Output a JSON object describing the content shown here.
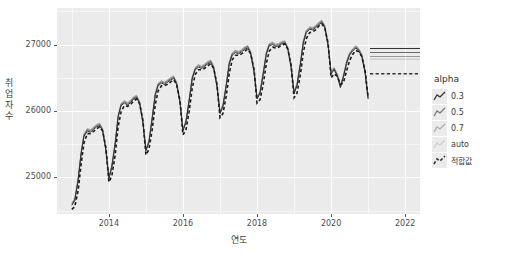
{
  "chart_data": {
    "type": "line",
    "title": "",
    "xlabel": "연도",
    "ylabel": "취업자 수",
    "xlim": [
      2012.6,
      2022.4
    ],
    "ylim": [
      24450,
      27550
    ],
    "xticks": [
      "2014",
      "2016",
      "2018",
      "2020",
      "2022"
    ],
    "xtick_values": [
      2014,
      2016,
      2018,
      2020,
      2022
    ],
    "yticks": [
      "25000",
      "26000",
      "27000"
    ],
    "ytick_values": [
      25000,
      26000,
      27000
    ],
    "grid": true,
    "legend_position": "right",
    "legend_title": "alpha",
    "series": [
      {
        "name": "0.3",
        "style": "solid",
        "opacity": 1.0,
        "color": "#333333",
        "x": [
          2013.0,
          2013.08,
          2013.17,
          2013.25,
          2013.33,
          2013.42,
          2013.5,
          2013.58,
          2013.67,
          2013.75,
          2013.83,
          2013.92,
          2014.0,
          2014.08,
          2014.17,
          2014.25,
          2014.33,
          2014.42,
          2014.5,
          2014.58,
          2014.67,
          2014.75,
          2014.83,
          2014.92,
          2015.0,
          2015.08,
          2015.17,
          2015.25,
          2015.33,
          2015.42,
          2015.5,
          2015.58,
          2015.67,
          2015.75,
          2015.83,
          2015.92,
          2016.0,
          2016.08,
          2016.17,
          2016.25,
          2016.33,
          2016.42,
          2016.5,
          2016.58,
          2016.67,
          2016.75,
          2016.83,
          2016.92,
          2017.0,
          2017.08,
          2017.17,
          2017.25,
          2017.33,
          2017.42,
          2017.5,
          2017.58,
          2017.67,
          2017.75,
          2017.83,
          2017.92,
          2018.0,
          2018.08,
          2018.17,
          2018.25,
          2018.33,
          2018.42,
          2018.5,
          2018.58,
          2018.67,
          2018.75,
          2018.83,
          2018.92,
          2019.0,
          2019.08,
          2019.17,
          2019.25,
          2019.33,
          2019.42,
          2019.5,
          2019.58,
          2019.67,
          2019.75,
          2019.83,
          2019.92,
          2020.0,
          2020.08,
          2020.17,
          2020.25,
          2020.33,
          2020.42,
          2020.5,
          2020.58,
          2020.67,
          2020.75,
          2020.83,
          2020.92,
          2021.0
        ],
        "values": [
          24580,
          24650,
          24950,
          25350,
          25620,
          25700,
          25680,
          25720,
          25760,
          25780,
          25700,
          25400,
          24980,
          25150,
          25500,
          25900,
          26080,
          26120,
          26090,
          26120,
          26180,
          26200,
          26110,
          25820,
          25400,
          25520,
          25880,
          26230,
          26380,
          26420,
          26400,
          26430,
          26470,
          26490,
          26400,
          26120,
          25700,
          25820,
          26150,
          26480,
          26620,
          26660,
          26640,
          26670,
          26710,
          26730,
          26640,
          26360,
          25960,
          26060,
          26380,
          26700,
          26840,
          26880,
          26860,
          26890,
          26930,
          26950,
          26860,
          26580,
          26180,
          26260,
          26560,
          26850,
          26980,
          27000,
          26970,
          26980,
          27010,
          27020,
          26930,
          26650,
          26260,
          26380,
          26700,
          27020,
          27180,
          27230,
          27220,
          27250,
          27300,
          27330,
          27250,
          26980,
          26560,
          26620,
          26520,
          26350,
          26500,
          26720,
          26840,
          26900,
          26950,
          26900,
          26820,
          26560,
          26180
        ]
      },
      {
        "name": "0.5",
        "style": "solid",
        "opacity": 0.65,
        "color": "#333333"
      },
      {
        "name": "0.7",
        "style": "solid",
        "opacity": 0.38,
        "color": "#333333"
      },
      {
        "name": "auto",
        "style": "solid",
        "opacity": 0.2,
        "color": "#333333"
      },
      {
        "name": "적합값",
        "style": "dashed",
        "opacity": 1.0,
        "color": "#1a1a1a",
        "x": [
          2013.0,
          2013.08,
          2013.17,
          2013.25,
          2013.33,
          2013.42,
          2013.5,
          2013.58,
          2013.67,
          2013.75,
          2013.83,
          2013.92,
          2014.0,
          2014.08,
          2014.17,
          2014.25,
          2014.33,
          2014.42,
          2014.5,
          2014.58,
          2014.67,
          2014.75,
          2014.83,
          2014.92,
          2015.0,
          2015.08,
          2015.17,
          2015.25,
          2015.33,
          2015.42,
          2015.5,
          2015.58,
          2015.67,
          2015.75,
          2015.83,
          2015.92,
          2016.0,
          2016.08,
          2016.17,
          2016.25,
          2016.33,
          2016.42,
          2016.5,
          2016.58,
          2016.67,
          2016.75,
          2016.83,
          2016.92,
          2017.0,
          2017.08,
          2017.17,
          2017.25,
          2017.33,
          2017.42,
          2017.5,
          2017.58,
          2017.67,
          2017.75,
          2017.83,
          2017.92,
          2018.0,
          2018.08,
          2018.17,
          2018.25,
          2018.33,
          2018.42,
          2018.5,
          2018.58,
          2018.67,
          2018.75,
          2018.83,
          2018.92,
          2019.0,
          2019.08,
          2019.17,
          2019.25,
          2019.33,
          2019.42,
          2019.5,
          2019.58,
          2019.67,
          2019.75,
          2019.83,
          2019.92,
          2020.0,
          2020.08,
          2020.17,
          2020.25,
          2020.33,
          2020.42,
          2020.5,
          2020.58,
          2020.67,
          2020.75,
          2020.83,
          2020.92,
          2021.0
        ],
        "values": [
          24520,
          24560,
          24800,
          25200,
          25520,
          25660,
          25660,
          25690,
          25730,
          25760,
          25700,
          25450,
          24930,
          25020,
          25340,
          25760,
          25990,
          26080,
          26070,
          26090,
          26150,
          26180,
          26110,
          25860,
          25340,
          25420,
          25720,
          26090,
          26300,
          26380,
          26380,
          26400,
          26440,
          26470,
          26400,
          26160,
          25640,
          25710,
          26000,
          26340,
          26550,
          26620,
          26620,
          26640,
          26680,
          26710,
          26640,
          26400,
          25900,
          25960,
          26230,
          26560,
          26770,
          26840,
          26840,
          26860,
          26900,
          26930,
          26860,
          26620,
          26120,
          26170,
          26410,
          26710,
          26900,
          26960,
          26950,
          26960,
          26990,
          27010,
          26930,
          26690,
          26200,
          26270,
          26550,
          26880,
          27090,
          27180,
          27190,
          27220,
          27280,
          27310,
          27250,
          27020,
          26500,
          26560,
          26520,
          26400,
          26420,
          26610,
          26760,
          26850,
          26910,
          26890,
          26820,
          26600,
          26200
        ]
      }
    ],
    "forecast": {
      "x_start": 2021.05,
      "x_end": 2022.4,
      "lines": [
        {
          "name": "0.3",
          "value": 26940,
          "style": "solid",
          "opacity": 1.0
        },
        {
          "name": "0.5",
          "value": 26880,
          "style": "solid",
          "opacity": 0.7
        },
        {
          "name": "0.7",
          "value": 26820,
          "style": "solid",
          "opacity": 0.45
        },
        {
          "name": "auto",
          "value": 26780,
          "style": "solid",
          "opacity": 0.22
        },
        {
          "name": "적합값",
          "value": 26560,
          "style": "dashed",
          "opacity": 1.0
        }
      ]
    }
  },
  "legend": {
    "title": "alpha",
    "items": [
      {
        "label": "0.3",
        "opacity": 1.0,
        "dash": false
      },
      {
        "label": "0.5",
        "opacity": 0.62,
        "dash": false
      },
      {
        "label": "0.7",
        "opacity": 0.34,
        "dash": false
      },
      {
        "label": "auto",
        "opacity": 0.16,
        "dash": false
      },
      {
        "label": "적합값",
        "opacity": 1.0,
        "dash": true
      }
    ]
  },
  "theme": {
    "panel_bg": "#ebebeb",
    "grid_color": "#ffffff",
    "line_color": "#333333",
    "text_color": "#4d4d4d",
    "page_bg": "#ffffff"
  }
}
